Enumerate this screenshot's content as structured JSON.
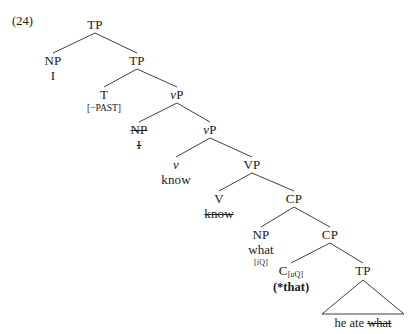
{
  "example": {
    "number": "(24)"
  },
  "diagram": {
    "type": "syntax-tree",
    "sentence_gloss": "I know what (*that) he ate",
    "nodes": [
      {
        "id": "tp-root",
        "label": "TP",
        "x": 95,
        "y": 18
      },
      {
        "id": "np-subj",
        "label": "NP",
        "x": 53,
        "y": 54,
        "word": "I"
      },
      {
        "id": "tp-bar",
        "label": "TP",
        "x": 137,
        "y": 54
      },
      {
        "id": "t-head",
        "label": "T",
        "x": 104,
        "y": 88,
        "feature": "[−PAST]"
      },
      {
        "id": "vp-little-top",
        "label": "vP",
        "x": 177,
        "y": 88
      },
      {
        "id": "np-trace",
        "label": "NP",
        "x": 139,
        "y": 123,
        "word": "I",
        "struck": true,
        "word_struck": true
      },
      {
        "id": "vp-little-bar",
        "label": "vP",
        "x": 210,
        "y": 123
      },
      {
        "id": "v-little",
        "label": "v",
        "x": 176,
        "y": 158,
        "word": "know"
      },
      {
        "id": "vp-big",
        "label": "VP",
        "x": 252,
        "y": 158
      },
      {
        "id": "v-head",
        "label": "V",
        "x": 219,
        "y": 192,
        "word": "know",
        "word_struck": true
      },
      {
        "id": "cp-top",
        "label": "CP",
        "x": 294,
        "y": 192
      },
      {
        "id": "np-what",
        "label": "NP",
        "x": 261,
        "y": 228,
        "word": "what",
        "feature": "[iQ]"
      },
      {
        "id": "cp-bar",
        "label": "CP",
        "x": 330,
        "y": 228
      },
      {
        "id": "c-head",
        "label": "C",
        "x": 291,
        "y": 264,
        "subscript": "[uQ]",
        "word": "(*that)",
        "word_bold": true
      },
      {
        "id": "tp-embed",
        "label": "TP",
        "x": 363,
        "y": 264
      }
    ],
    "edges": [
      [
        "tp-root",
        "np-subj"
      ],
      [
        "tp-root",
        "tp-bar"
      ],
      [
        "tp-bar",
        "t-head"
      ],
      [
        "tp-bar",
        "vp-little-top"
      ],
      [
        "vp-little-top",
        "np-trace"
      ],
      [
        "vp-little-top",
        "vp-little-bar"
      ],
      [
        "vp-little-bar",
        "v-little"
      ],
      [
        "vp-little-bar",
        "vp-big"
      ],
      [
        "vp-big",
        "v-head"
      ],
      [
        "vp-big",
        "cp-top"
      ],
      [
        "cp-top",
        "np-what"
      ],
      [
        "cp-top",
        "cp-bar"
      ],
      [
        "cp-bar",
        "c-head"
      ],
      [
        "cp-bar",
        "tp-embed"
      ]
    ],
    "triangle": {
      "parent": "tp-embed",
      "apex_x": 363,
      "apex_y": 280,
      "left_x": 322,
      "right_x": 404,
      "base_y": 314,
      "text": "he ate what",
      "text_plain": "he ate ",
      "text_struck": "what",
      "text_x": 363,
      "text_y": 316
    },
    "style": {
      "line_color": "#2b2b2b",
      "text_color": "#1a1a1a",
      "background": "#ffffff"
    }
  }
}
